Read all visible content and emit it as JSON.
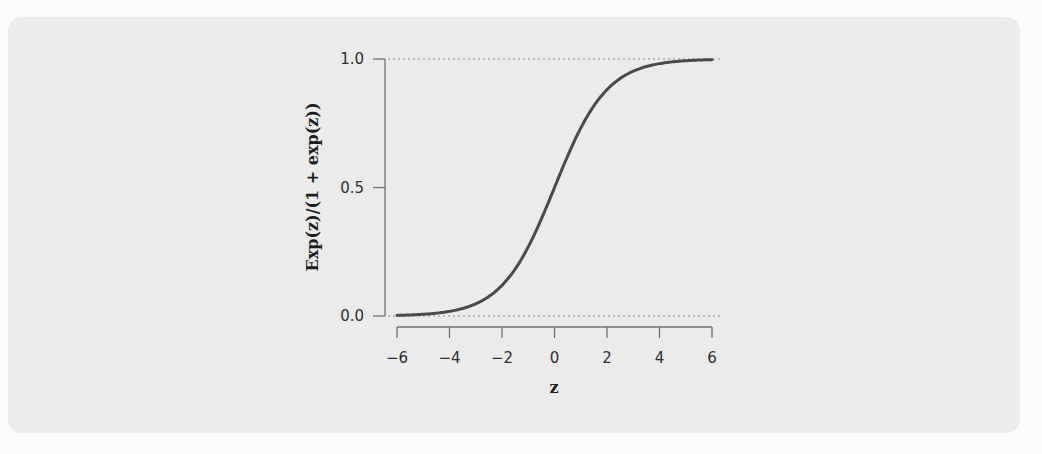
{
  "chart_data": {
    "type": "line",
    "title": "",
    "xlabel": "z",
    "ylabel": "Exp(z)/(1 + exp(z))",
    "xlim": [
      -6,
      6
    ],
    "ylim": [
      0,
      1
    ],
    "x_ticks": [
      "−6",
      "−4",
      "−2",
      "0",
      "2",
      "4",
      "6"
    ],
    "y_ticks": [
      "0.0",
      "0.5",
      "1.0"
    ],
    "grid": false,
    "reference_lines": [
      {
        "y": 0.0,
        "style": "dotted"
      },
      {
        "y": 1.0,
        "style": "dotted"
      }
    ],
    "series": [
      {
        "name": "logistic",
        "x": [
          -6,
          -5,
          -4,
          -3,
          -2,
          -1,
          0,
          1,
          2,
          3,
          4,
          5,
          6
        ],
        "values": [
          0.0025,
          0.0067,
          0.018,
          0.047,
          0.119,
          0.269,
          0.5,
          0.731,
          0.881,
          0.953,
          0.982,
          0.9933,
          0.9975
        ]
      }
    ],
    "colors": {
      "line": "#4a4a4a",
      "axis": "#707070",
      "reference": "#8a8a8a"
    }
  }
}
